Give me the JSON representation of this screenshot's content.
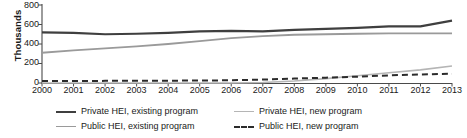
{
  "chart_data": {
    "type": "line",
    "title": "",
    "xlabel": "",
    "ylabel": "Thousands",
    "ylim": [
      0,
      800
    ],
    "yticks": [
      0,
      200,
      400,
      600,
      800
    ],
    "grid": false,
    "legend_position": "bottom",
    "x": [
      2000,
      2001,
      2002,
      2003,
      2004,
      2005,
      2006,
      2007,
      2008,
      2009,
      2010,
      2011,
      2012,
      2013
    ],
    "categories": [
      "2000",
      "2001",
      "2002",
      "2003",
      "2004",
      "2005",
      "2006",
      "2007",
      "2008",
      "2009",
      "2010",
      "2011",
      "2012",
      "2013"
    ],
    "series": [
      {
        "name": "Private HEI, existing program",
        "color": "#3f3f3f",
        "style": "solid",
        "width": 2.2,
        "values": [
          520,
          515,
          500,
          505,
          515,
          530,
          535,
          530,
          545,
          555,
          565,
          580,
          580,
          640
        ]
      },
      {
        "name": "Public HEI, existing program",
        "color": "#9a9a9a",
        "style": "solid",
        "width": 1.8,
        "values": [
          310,
          335,
          355,
          375,
          400,
          430,
          460,
          480,
          495,
          500,
          505,
          510,
          510,
          510
        ]
      },
      {
        "name": "Private HEI, new program",
        "color": "#b5b5b5",
        "style": "solid",
        "width": 1.6,
        "values": [
          0,
          0,
          0,
          0,
          0,
          0,
          0,
          5,
          20,
          45,
          75,
          105,
          135,
          175
        ]
      },
      {
        "name": "Public HEI, new program",
        "color": "#2b2b2b",
        "style": "dashed",
        "width": 2.0,
        "values": [
          20,
          20,
          22,
          22,
          24,
          25,
          28,
          35,
          45,
          55,
          65,
          78,
          88,
          95
        ]
      }
    ]
  },
  "axis": {
    "y_title": "Thousands",
    "y_tick_labels": [
      "800",
      "600",
      "400",
      "200",
      "0"
    ],
    "x_tick_labels": [
      "2000",
      "2001",
      "2002",
      "2003",
      "2004",
      "2005",
      "2006",
      "2007",
      "2008",
      "2009",
      "2010",
      "2011",
      "2012",
      "2013"
    ]
  },
  "legend": {
    "items": [
      {
        "label": "Private HEI, existing program",
        "color": "#3f3f3f",
        "style": "solid",
        "thickness": 2.4
      },
      {
        "label": "Private HEI, new program",
        "color": "#b5b5b5",
        "style": "solid",
        "thickness": 1.6
      },
      {
        "label": "Public HEI, existing program",
        "color": "#9a9a9a",
        "style": "solid",
        "thickness": 1.8
      },
      {
        "label": "Public HEI, new program",
        "color": "#2b2b2b",
        "style": "dashed",
        "thickness": 2.2
      }
    ]
  }
}
